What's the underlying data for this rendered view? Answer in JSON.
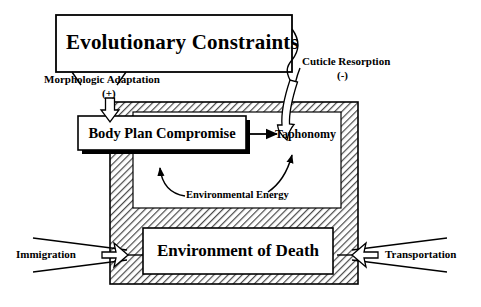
{
  "diagram": {
    "title_box": {
      "label": "Evolutionary Constraints"
    },
    "boxes": [
      {
        "id": "body-plan-compromise",
        "label": "Body Plan Compromise"
      },
      {
        "id": "environment-of-death",
        "label": "Environment of Death"
      }
    ],
    "nodes": [
      {
        "id": "taphonomy",
        "label": "Taphonomy"
      }
    ],
    "arrow_labels": [
      {
        "id": "morphologic-adaptation",
        "label": "Morphologic Adaptation",
        "sign": "(+)"
      },
      {
        "id": "cuticle-resorption",
        "label": "Cuticle Resorption",
        "sign": "(-)"
      },
      {
        "id": "environmental-energy",
        "label": "Environmental  Energy"
      },
      {
        "id": "immigration",
        "label": "Immigration"
      },
      {
        "id": "transportation",
        "label": "Transportation"
      }
    ],
    "colors": {
      "stroke": "#000000",
      "background": "#ffffff",
      "hatch_line": "#555555",
      "hatch_fill": "#ffffff",
      "shadow": "#000000"
    }
  }
}
